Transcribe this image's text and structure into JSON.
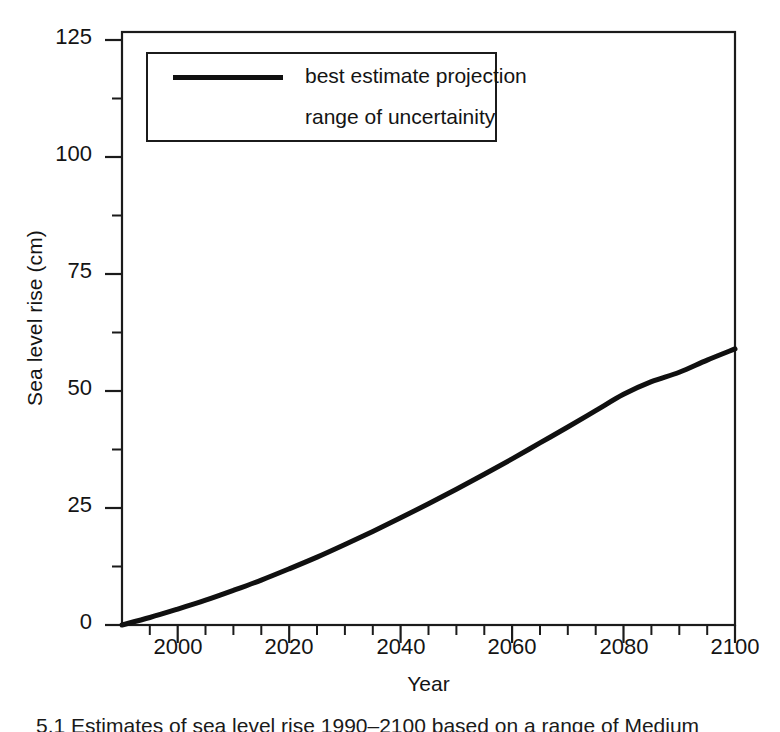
{
  "figure": {
    "caption_partial": "5.1 Estimates of sea level rise 1990–2100 based on a range of Medium"
  },
  "chart_data": {
    "type": "line",
    "title": "",
    "xlabel": "Year",
    "ylabel": "Sea level rise (cm)",
    "xlim": [
      1990,
      2100
    ],
    "ylim": [
      0,
      131
    ],
    "grid": false,
    "legend_position": "top-left",
    "x_ticks": [
      2000,
      2020,
      2040,
      2060,
      2080,
      2100
    ],
    "x_minor_ticks": [
      1995,
      2005,
      2010,
      2015,
      2025,
      2030,
      2035,
      2045,
      2050,
      2055,
      2065,
      2070,
      2075,
      2085,
      2090,
      2095
    ],
    "y_ticks": [
      0,
      25,
      50,
      75,
      100,
      125
    ],
    "y_minor_ticks": [
      12.5,
      37.5,
      62.5,
      87.5,
      112.5
    ],
    "series": [
      {
        "name": "best estimate projection",
        "color": "#101010",
        "x": [
          1990,
          1995,
          2000,
          2005,
          2010,
          2015,
          2020,
          2025,
          2030,
          2035,
          2040,
          2045,
          2050,
          2055,
          2060,
          2065,
          2070,
          2075,
          2080,
          2085,
          2090,
          2095,
          2100
        ],
        "y": [
          0,
          1.6,
          3.4,
          5.3,
          7.4,
          9.6,
          12.0,
          14.5,
          17.2,
          20.0,
          22.9,
          25.9,
          29.0,
          32.2,
          35.5,
          38.9,
          42.3,
          45.8,
          49.3,
          52.0,
          54.0,
          56.6,
          59.0
        ]
      },
      {
        "name": "range of uncertainity",
        "color": "#101010",
        "x": [],
        "y": []
      }
    ],
    "legend_entries": [
      {
        "label": "best estimate projection",
        "marker": "line"
      },
      {
        "label": "range of uncertainity",
        "marker": "none"
      }
    ]
  },
  "y_tick_labels": [
    "125",
    "100",
    "75",
    "50",
    "25",
    "0"
  ],
  "x_tick_labels": [
    "2000",
    "2020",
    "2040",
    "2060",
    "2080",
    "2100"
  ]
}
